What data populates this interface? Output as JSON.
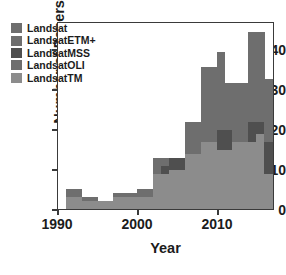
{
  "chart_data": {
    "type": "bar",
    "stacked": true,
    "title": "",
    "xlabel": "Year",
    "ylabel": "Number of Papers",
    "xlim": [
      1990,
      2017
    ],
    "ylim": [
      0,
      47
    ],
    "xticks": [
      1990,
      2000,
      2010
    ],
    "yticks": [
      0,
      10,
      20,
      30,
      40
    ],
    "grid": false,
    "legend_position": "upper-left",
    "categories": [
      1991,
      1992,
      1993,
      1994,
      1995,
      1996,
      1997,
      1998,
      1999,
      2000,
      2001,
      2002,
      2003,
      2004,
      2005,
      2006,
      2007,
      2008,
      2009,
      2010,
      2011,
      2012,
      2013,
      2014,
      2015,
      2016
    ],
    "series": [
      {
        "name": "LandsatTM",
        "color": "#8c8c8c",
        "values": [
          0,
          0,
          0,
          2,
          2,
          0,
          0,
          3,
          3,
          3,
          3,
          9,
          9,
          9,
          10,
          10,
          14,
          16,
          17,
          15,
          15,
          17,
          17,
          17,
          19,
          9
        ]
      },
      {
        "name": "LandsatMSS",
        "color": "#4f4f4f",
        "values": [
          0,
          0,
          0,
          0,
          0,
          0,
          0,
          0,
          0,
          0,
          0,
          2,
          2,
          3,
          3,
          3,
          0,
          0,
          0,
          5,
          5,
          0,
          0,
          5,
          3,
          8
        ]
      },
      {
        "name": "LandsatETM+",
        "color": "#6e6e6e",
        "values": [
          0,
          5,
          3,
          1,
          1,
          0,
          0,
          1,
          1,
          1,
          2,
          2,
          3,
          1,
          0,
          0,
          8,
          8,
          3,
          0,
          0,
          3,
          3,
          0,
          8,
          16
        ]
      },
      {
        "name": "Landsat",
        "color": "#6e6e6e",
        "values": [
          0,
          0,
          0,
          0,
          0,
          0,
          0,
          0,
          0,
          0,
          0,
          0,
          0,
          0,
          0,
          0,
          0,
          12,
          16,
          20,
          12,
          12,
          12,
          23,
          15,
          0
        ]
      },
      {
        "name": "LandsatOLI",
        "color": "#6e6e6e",
        "values": [
          0,
          0,
          0,
          0,
          0,
          0,
          0,
          0,
          0,
          0,
          0,
          0,
          0,
          0,
          0,
          0,
          0,
          0,
          0,
          0,
          0,
          0,
          0,
          0,
          0,
          0
        ]
      }
    ],
    "legend": [
      {
        "label": "Landsat",
        "color": "#6e6e6e"
      },
      {
        "label": "LandsatETM+",
        "color": "#6e6e6e"
      },
      {
        "label": "LandsatMSS",
        "color": "#4f4f4f"
      },
      {
        "label": "LandsatOLI",
        "color": "#6e6e6e"
      },
      {
        "label": "LandsatTM",
        "color": "#8c8c8c"
      }
    ],
    "bars": [
      {
        "year": 1991,
        "total": 5,
        "segments": [
          {
            "series": "LandsatTM",
            "from": 0,
            "to": 3
          },
          {
            "series": "LandsatETM+",
            "from": 3,
            "to": 5
          }
        ]
      },
      {
        "year": 1992,
        "total": 5,
        "segments": [
          {
            "series": "LandsatTM",
            "from": 0,
            "to": 3
          },
          {
            "series": "LandsatETM+",
            "from": 3,
            "to": 5
          }
        ]
      },
      {
        "year": 1993,
        "total": 3,
        "segments": [
          {
            "series": "LandsatTM",
            "from": 0,
            "to": 2
          },
          {
            "series": "LandsatETM+",
            "from": 2,
            "to": 3
          }
        ]
      },
      {
        "year": 1994,
        "total": 3,
        "segments": [
          {
            "series": "LandsatTM",
            "from": 0,
            "to": 2
          },
          {
            "series": "LandsatETM+",
            "from": 2,
            "to": 3
          }
        ]
      },
      {
        "year": 1995,
        "total": 2,
        "segments": [
          {
            "series": "LandsatTM",
            "from": 0,
            "to": 2
          }
        ]
      },
      {
        "year": 1996,
        "total": 2,
        "segments": [
          {
            "series": "LandsatTM",
            "from": 0,
            "to": 2
          }
        ]
      },
      {
        "year": 1997,
        "total": 4,
        "segments": [
          {
            "series": "LandsatTM",
            "from": 0,
            "to": 3
          },
          {
            "series": "LandsatETM+",
            "from": 3,
            "to": 4
          }
        ]
      },
      {
        "year": 1998,
        "total": 4,
        "segments": [
          {
            "series": "LandsatTM",
            "from": 0,
            "to": 3
          },
          {
            "series": "LandsatETM+",
            "from": 3,
            "to": 4
          }
        ]
      },
      {
        "year": 1999,
        "total": 4,
        "segments": [
          {
            "series": "LandsatTM",
            "from": 0,
            "to": 3
          },
          {
            "series": "LandsatETM+",
            "from": 3,
            "to": 4
          }
        ]
      },
      {
        "year": 2000,
        "total": 5,
        "segments": [
          {
            "series": "LandsatTM",
            "from": 0,
            "to": 3
          },
          {
            "series": "LandsatETM+",
            "from": 3,
            "to": 5
          }
        ]
      },
      {
        "year": 2001,
        "total": 5,
        "segments": [
          {
            "series": "LandsatTM",
            "from": 0,
            "to": 3
          },
          {
            "series": "LandsatETM+",
            "from": 3,
            "to": 5
          }
        ]
      },
      {
        "year": 2002,
        "total": 13,
        "segments": [
          {
            "series": "LandsatTM",
            "from": 0,
            "to": 9
          },
          {
            "series": "LandsatETM+",
            "from": 9,
            "to": 13
          }
        ]
      },
      {
        "year": 2003,
        "total": 13,
        "segments": [
          {
            "series": "LandsatTM",
            "from": 0,
            "to": 9
          },
          {
            "series": "LandsatMSS",
            "from": 9,
            "to": 11
          },
          {
            "series": "LandsatETM+",
            "from": 11,
            "to": 13
          }
        ]
      },
      {
        "year": 2004,
        "total": 13,
        "segments": [
          {
            "series": "LandsatTM",
            "from": 0,
            "to": 10
          },
          {
            "series": "LandsatMSS",
            "from": 10,
            "to": 13
          }
        ]
      },
      {
        "year": 2005,
        "total": 13,
        "segments": [
          {
            "series": "LandsatTM",
            "from": 0,
            "to": 10
          },
          {
            "series": "LandsatMSS",
            "from": 10,
            "to": 13
          }
        ]
      },
      {
        "year": 2006,
        "total": 22,
        "segments": [
          {
            "series": "LandsatTM",
            "from": 0,
            "to": 14
          },
          {
            "series": "LandsatETM+",
            "from": 14,
            "to": 22
          }
        ]
      },
      {
        "year": 2007,
        "total": 22,
        "segments": [
          {
            "series": "LandsatTM",
            "from": 0,
            "to": 14
          },
          {
            "series": "LandsatETM+",
            "from": 14,
            "to": 22
          }
        ]
      },
      {
        "year": 2008,
        "total": 36,
        "segments": [
          {
            "series": "LandsatTM",
            "from": 0,
            "to": 17
          },
          {
            "series": "Landsat",
            "from": 17,
            "to": 36
          }
        ]
      },
      {
        "year": 2009,
        "total": 36,
        "segments": [
          {
            "series": "LandsatTM",
            "from": 0,
            "to": 17
          },
          {
            "series": "Landsat",
            "from": 17,
            "to": 36
          }
        ]
      },
      {
        "year": 2010,
        "total": 40,
        "segments": [
          {
            "series": "LandsatTM",
            "from": 0,
            "to": 15
          },
          {
            "series": "LandsatMSS",
            "from": 15,
            "to": 20
          },
          {
            "series": "Landsat",
            "from": 20,
            "to": 40
          }
        ]
      },
      {
        "year": 2011,
        "total": 32,
        "segments": [
          {
            "series": "LandsatTM",
            "from": 0,
            "to": 15
          },
          {
            "series": "LandsatMSS",
            "from": 15,
            "to": 20
          },
          {
            "series": "Landsat",
            "from": 20,
            "to": 32
          }
        ]
      },
      {
        "year": 2012,
        "total": 32,
        "segments": [
          {
            "series": "LandsatTM",
            "from": 0,
            "to": 17
          },
          {
            "series": "Landsat",
            "from": 17,
            "to": 32
          }
        ]
      },
      {
        "year": 2013,
        "total": 32,
        "segments": [
          {
            "series": "LandsatTM",
            "from": 0,
            "to": 17
          },
          {
            "series": "Landsat",
            "from": 17,
            "to": 32
          }
        ]
      },
      {
        "year": 2014,
        "total": 45,
        "segments": [
          {
            "series": "LandsatTM",
            "from": 0,
            "to": 17
          },
          {
            "series": "LandsatMSS",
            "from": 17,
            "to": 22
          },
          {
            "series": "Landsat",
            "from": 22,
            "to": 45
          }
        ]
      },
      {
        "year": 2015,
        "total": 45,
        "segments": [
          {
            "series": "LandsatTM",
            "from": 0,
            "to": 19
          },
          {
            "series": "LandsatMSS",
            "from": 19,
            "to": 22
          },
          {
            "series": "Landsat",
            "from": 22,
            "to": 45
          }
        ]
      },
      {
        "year": 2016,
        "total": 33,
        "segments": [
          {
            "series": "LandsatTM",
            "from": 0,
            "to": 9
          },
          {
            "series": "LandsatMSS",
            "from": 9,
            "to": 17
          },
          {
            "series": "LandsatETM+",
            "from": 17,
            "to": 33
          }
        ]
      }
    ]
  },
  "axis": {
    "y_title": "Number of Papers",
    "x_title": "Year",
    "y_tick_labels": [
      "40",
      "30",
      "20",
      "10",
      "0"
    ],
    "x_tick_labels": [
      "1990",
      "2000",
      "2010"
    ]
  },
  "colors": {
    "axis": "#3a3a3a",
    "text": "#1c1c1c",
    "background": "#ffffff"
  }
}
